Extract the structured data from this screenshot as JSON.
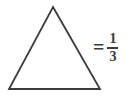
{
  "figure": {
    "type": "geometry-fraction-equation",
    "background_color": "#ffffff",
    "stroke_color": "#3a3a3a"
  },
  "shape": {
    "name": "triangle",
    "fill": "none",
    "stroke_color": "#3a3a3a",
    "stroke_width": "1.8",
    "points": "53,7 100,89 9,89",
    "apex_label": "",
    "vertices": [
      {
        "x": 53,
        "y": 7
      },
      {
        "x": 100,
        "y": 89
      },
      {
        "x": 9,
        "y": 89
      }
    ]
  },
  "equation": {
    "equals_symbol": "=",
    "fraction": {
      "numerator": "1",
      "denominator": "3",
      "value_text": "1/3"
    }
  }
}
